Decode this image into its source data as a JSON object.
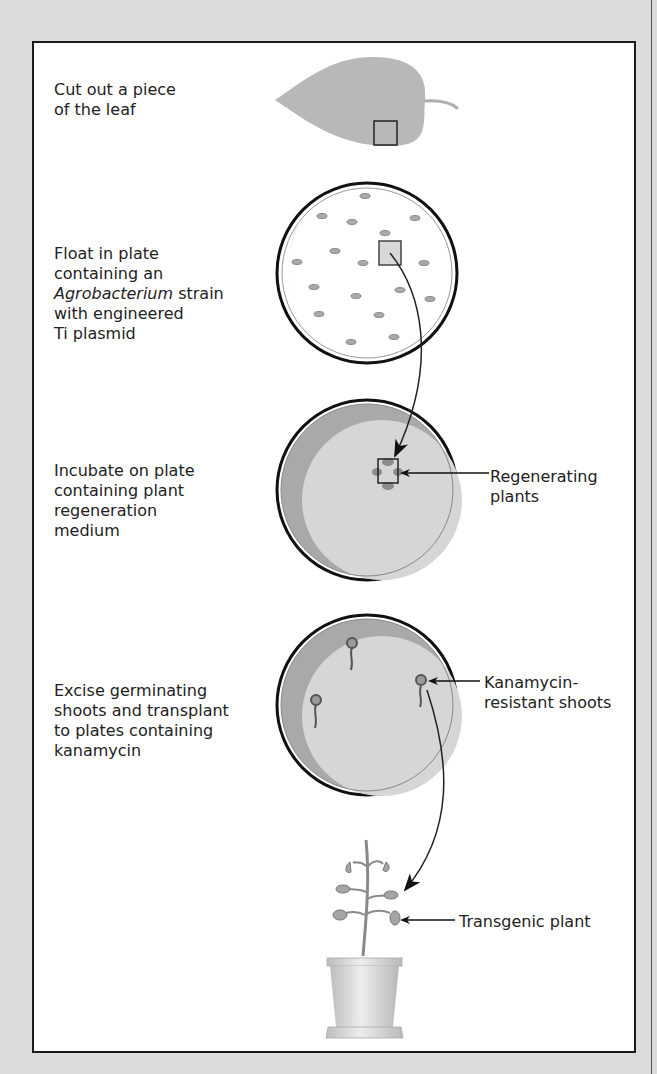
{
  "steps": [
    {
      "id": "cut",
      "lines": [
        "Cut out a piece",
        "of the leaf"
      ]
    },
    {
      "id": "float",
      "lines": [
        "Float in plate",
        "containing an"
      ],
      "italic": "Agrobacterium",
      "after_italic": " strain",
      "more_lines": [
        "with engineered",
        "Ti plasmid"
      ]
    },
    {
      "id": "incubate",
      "lines": [
        "Incubate on plate",
        "containing plant",
        "regeneration",
        "medium"
      ]
    },
    {
      "id": "excise",
      "lines": [
        "Excise germinating",
        "shoots and transplant",
        "to plates containing",
        "kanamycin"
      ]
    }
  ],
  "labels": {
    "regenerating": [
      "Regenerating",
      "plants"
    ],
    "kanamycin": [
      "Kanamycin-",
      "resistant shoots"
    ],
    "transgenic": "Transgenic plant"
  },
  "colors": {
    "background": "#dcdcdc",
    "frame_border": "#1a1a1a",
    "leaf": "#b8b8b8",
    "medium": "#d6d6d6",
    "medium_shadow": "#a9a9a9"
  }
}
